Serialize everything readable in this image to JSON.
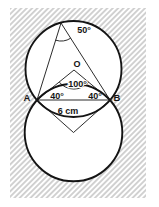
{
  "figure": {
    "type": "geometry-diagram",
    "labels": {
      "inscribed_angle": "50°",
      "center_point": "O",
      "central_angle": "100°",
      "left_base_angle": "40°",
      "right_base_angle": "40°",
      "chord_length": "6 cm",
      "left_point": "A",
      "right_point": "B"
    },
    "colors": {
      "line": "#141414",
      "hatch": "#8f8f8f",
      "background": "#ffffff"
    }
  }
}
